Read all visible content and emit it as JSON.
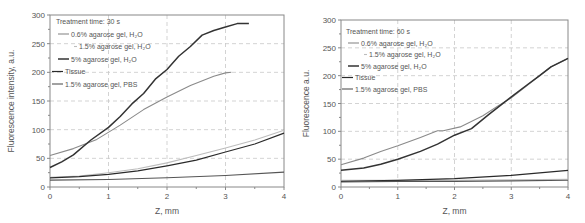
{
  "chart_data": [
    {
      "type": "line",
      "title": "Treatment time: 30 s",
      "xlabel": "Z, mm",
      "ylabel": "Fluorescence intensity, a.u.",
      "xlim": [
        0,
        4
      ],
      "ylim": [
        0,
        300
      ],
      "xticks": [
        0,
        1,
        2,
        3,
        4
      ],
      "yticks": [
        0,
        50,
        100,
        150,
        200,
        250,
        300
      ],
      "grid": true,
      "legend_position": "upper left",
      "series": [
        {
          "name": "0.6% agarose gel, H2O",
          "color": "#8a8a8a",
          "width": 1.1,
          "points": [
            [
              0,
              55
            ],
            [
              0.4,
              67
            ],
            [
              0.8,
              83
            ],
            [
              1.2,
              108
            ],
            [
              1.6,
              135
            ],
            [
              2.0,
              157
            ],
            [
              2.4,
              177
            ],
            [
              2.8,
              193
            ],
            [
              3.0,
              199
            ],
            [
              3.1,
              200
            ]
          ]
        },
        {
          "name": "1.5% agarose gel, H2O",
          "color": "#bdbdbd",
          "width": 1.1,
          "points": [
            [
              0,
              17
            ],
            [
              0.5,
              19
            ],
            [
              1.0,
              25
            ],
            [
              1.5,
              32
            ],
            [
              2.0,
              42
            ],
            [
              2.5,
              55
            ],
            [
              3.0,
              68
            ],
            [
              3.5,
              82
            ],
            [
              4.0,
              99
            ]
          ]
        },
        {
          "name": "5% agarose gel, H2O",
          "color": "#333333",
          "width": 1.5,
          "points": [
            [
              0,
              34
            ],
            [
              0.2,
              44
            ],
            [
              0.4,
              56
            ],
            [
              0.7,
              82
            ],
            [
              1.0,
              104
            ],
            [
              1.2,
              123
            ],
            [
              1.4,
              145
            ],
            [
              1.6,
              163
            ],
            [
              1.8,
              188
            ],
            [
              2.0,
              205
            ],
            [
              2.2,
              228
            ],
            [
              2.4,
              245
            ],
            [
              2.6,
              265
            ],
            [
              2.8,
              273
            ],
            [
              3.0,
              279
            ],
            [
              3.2,
              285
            ],
            [
              3.4,
              285
            ]
          ]
        },
        {
          "name": "Tissue",
          "color": "#2a2a2a",
          "width": 1.2,
          "points": [
            [
              0,
              16
            ],
            [
              0.5,
              18
            ],
            [
              1.0,
              22
            ],
            [
              1.5,
              28
            ],
            [
              2.0,
              37
            ],
            [
              2.5,
              47
            ],
            [
              3.0,
              61
            ],
            [
              3.5,
              75
            ],
            [
              4.0,
              94
            ]
          ]
        },
        {
          "name": "1.5% agarose gel, PBS",
          "color": "#555555",
          "width": 1.1,
          "points": [
            [
              0,
              12
            ],
            [
              1.0,
              13
            ],
            [
              2.0,
              16
            ],
            [
              3.0,
              20
            ],
            [
              4.0,
              26
            ]
          ]
        }
      ]
    },
    {
      "type": "line",
      "title": "Treatment time: 60 s",
      "xlabel": "Z, mm",
      "ylabel": "Fluorescence a.u.",
      "xlim": [
        0,
        4
      ],
      "ylim": [
        0,
        300
      ],
      "xticks": [
        0,
        1,
        2,
        3,
        4
      ],
      "yticks": [
        0,
        50,
        100,
        150,
        200,
        250,
        300
      ],
      "grid": true,
      "legend_position": "upper left",
      "series": [
        {
          "name": "0.6% agarose gel, H2O",
          "color": "#8a8a8a",
          "width": 1.1,
          "points": [
            [
              0,
              40
            ],
            [
              0.4,
              52
            ],
            [
              0.7,
              64
            ],
            [
              1.0,
              74
            ],
            [
              1.4,
              89
            ],
            [
              1.7,
              101
            ],
            [
              1.8,
              101
            ],
            [
              2.1,
              108
            ],
            [
              2.5,
              128
            ],
            [
              2.8,
              148
            ],
            [
              3.0,
              160
            ],
            [
              3.5,
              200
            ],
            [
              3.7,
              216
            ],
            [
              4.0,
              231
            ]
          ]
        },
        {
          "name": "1.5% agarose gel, H2O",
          "color": "#bdbdbd",
          "width": 1.1,
          "points": [
            [
              0,
              12
            ],
            [
              1.0,
              12
            ],
            [
              2.0,
              12
            ],
            [
              3.0,
              13
            ],
            [
              4.0,
              14
            ]
          ]
        },
        {
          "name": "5% agarose gel, H2O",
          "color": "#333333",
          "width": 1.5,
          "points": [
            [
              0,
              30
            ],
            [
              0.4,
              34
            ],
            [
              0.7,
              41
            ],
            [
              1.0,
              50
            ],
            [
              1.4,
              64
            ],
            [
              1.7,
              77
            ],
            [
              2.0,
              93
            ],
            [
              2.3,
              105
            ],
            [
              2.6,
              130
            ],
            [
              3.0,
              162
            ],
            [
              3.3,
              185
            ],
            [
              3.5,
              200
            ],
            [
              3.7,
              216
            ],
            [
              4.0,
              231
            ]
          ]
        },
        {
          "name": "Tissue",
          "color": "#2a2a2a",
          "width": 1.2,
          "points": [
            [
              0,
              10
            ],
            [
              1.0,
              12
            ],
            [
              2.0,
              15
            ],
            [
              3.0,
              21
            ],
            [
              4.0,
              30
            ]
          ]
        },
        {
          "name": "1.5% agarose gel, PBS",
          "color": "#555555",
          "width": 1.1,
          "points": [
            [
              0,
              9
            ],
            [
              1.0,
              10
            ],
            [
              2.0,
              10
            ],
            [
              3.0,
              11
            ],
            [
              4.0,
              12
            ]
          ]
        }
      ]
    }
  ],
  "panels": [
    {
      "title": "Treatment time: 30 s",
      "ylabel": "Fluorescence intensity, a.u.",
      "xlabel": "Z, mm",
      "legend": [
        "0.6% agarose gel, H₂O",
        "1.5% agarose gel, H₂O",
        "5% agarose gel, H₂O",
        "Tissue",
        "1.5% agarose gel, PBS"
      ]
    },
    {
      "title": "Treatment time: 60 s",
      "ylabel": "Fluorescence a.u.",
      "xlabel": "Z, mm",
      "legend": [
        "0.6% agarose gel, H₂O",
        "1.5% agarose gel, H₂O",
        "5% agarose gel, H₂O",
        "Tissue",
        "1.5% agarose gel, PBS"
      ]
    }
  ]
}
